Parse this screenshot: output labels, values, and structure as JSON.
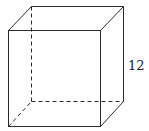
{
  "figure": {
    "shape": "cube",
    "edge_label": "12",
    "labeled_edge": "right vertical edge",
    "hidden_edges_style": "dashed",
    "line_color": "#2a2a2a"
  }
}
